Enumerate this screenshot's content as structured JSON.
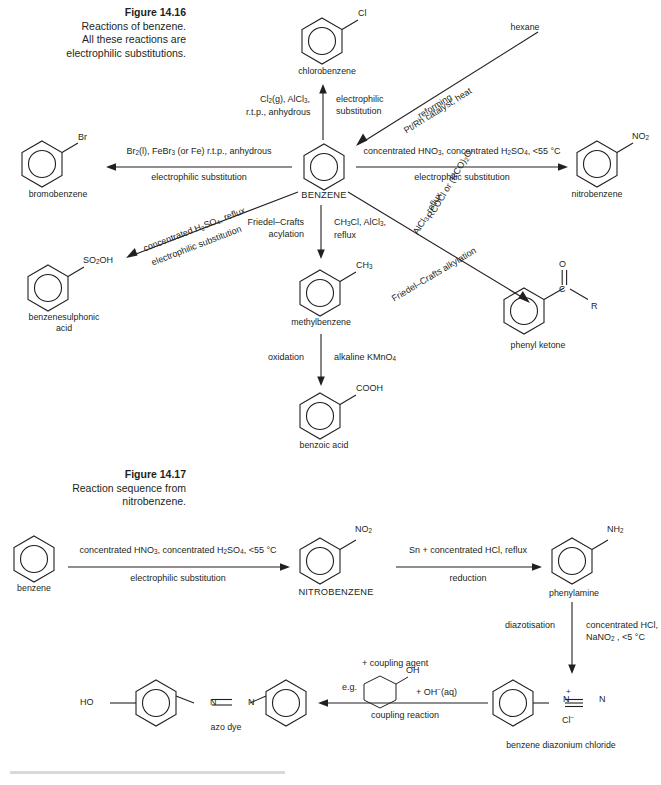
{
  "figure1": {
    "caption_title": "Figure 14.16",
    "caption_lines": [
      "Reactions of benzene.",
      "All these reactions are",
      "electrophilic substitutions."
    ],
    "center_label": "BENZENE",
    "products": {
      "chlorobenzene": {
        "name": "chlorobenzene",
        "substituent": "Cl"
      },
      "bromobenzene": {
        "name": "bromobenzene",
        "substituent": "Br"
      },
      "nitrobenzene": {
        "name": "nitrobenzene",
        "substituent": "NO2"
      },
      "benzenesulphonic": {
        "name_line1": "benzenesulphonic",
        "name_line2": "acid",
        "substituent": "SO2OH"
      },
      "methylbenzene": {
        "name": "methylbenzene",
        "substituent": "CH3"
      },
      "benzoic_acid": {
        "name": "benzoic acid",
        "substituent": "COOH"
      },
      "phenyl_ketone": {
        "name": "phenyl ketone",
        "atom_o": "O",
        "atom_c": "C",
        "atom_r": "R"
      },
      "hexane": {
        "name": "hexane"
      }
    },
    "arrows": {
      "chlorination": {
        "reagents_line1": "Cl2(g), AlCl3,",
        "reagents_line2": "r.t.p., anhydrous",
        "type_line1": "electrophilic",
        "type_line2": "substitution"
      },
      "bromination": {
        "reagents": "Br2(l), FeBr3 (or Fe) r.t.p., anhydrous",
        "type": "electrophilic substitution"
      },
      "nitration": {
        "reagents": "concentrated HNO3,  concentrated H2SO4, <55 °C",
        "type": "electrophilic substitution"
      },
      "reforming": {
        "reagents": "reforming",
        "type": "Pt/Rh catalyst, heat"
      },
      "sulphonation": {
        "reagents": "concentrated H2SO4, reflux",
        "type": "electrophilic substitution"
      },
      "alkylation": {
        "type_line1": "Friedel–Crafts",
        "type_line2": "acylation",
        "reagents_line1": "CH3Cl, AlCl3,",
        "reagents_line2": "reflux"
      },
      "acylation": {
        "reagents_line1": "RCOCl or (RCO)2O,",
        "reagents_line2": "AlCl3, reflux",
        "type": "Friedel–Crafts alkylation"
      },
      "oxidation": {
        "type": "oxidation",
        "reagents": "alkaline KMnO4"
      }
    }
  },
  "figure2": {
    "caption_title": "Figure 14.17",
    "caption_lines": [
      "Reaction sequence from",
      "nitrobenzene."
    ],
    "species": {
      "benzene": {
        "name": "benzene"
      },
      "nitrobenzene": {
        "name": "NITROBENZENE",
        "substituent": "NO2"
      },
      "phenylamine": {
        "name": "phenylamine",
        "substituent": "NH2"
      },
      "diazonium": {
        "name": "benzene diazonium chloride",
        "n_plus": "N",
        "n_end": "N",
        "charge_plus": "+",
        "counter_ion": "Cl",
        "counter_charge": "−"
      },
      "azo_dye": {
        "name": "azo dye",
        "ho": "HO",
        "n1": "N",
        "n2": "N"
      }
    },
    "arrows": {
      "nitration": {
        "reagents": "concentrated HNO3, concentrated H2SO4, <55 °C",
        "type": "electrophilic substitution"
      },
      "reduction": {
        "reagents": "Sn + concentrated HCl, reflux",
        "type": "reduction"
      },
      "diazotisation": {
        "type": "diazotisation",
        "reagents_line1": "concentrated HCl,",
        "reagents_line2": "NaNO2 , <5 °C"
      },
      "coupling": {
        "header": "+ coupling agent",
        "eg": "e.g.",
        "phenol_oh": "OH",
        "plus_oh": "+  OH−(aq)",
        "type": "coupling reaction"
      }
    }
  },
  "colors": {
    "ink": "#231f20",
    "rule": "#d9d9d9"
  }
}
